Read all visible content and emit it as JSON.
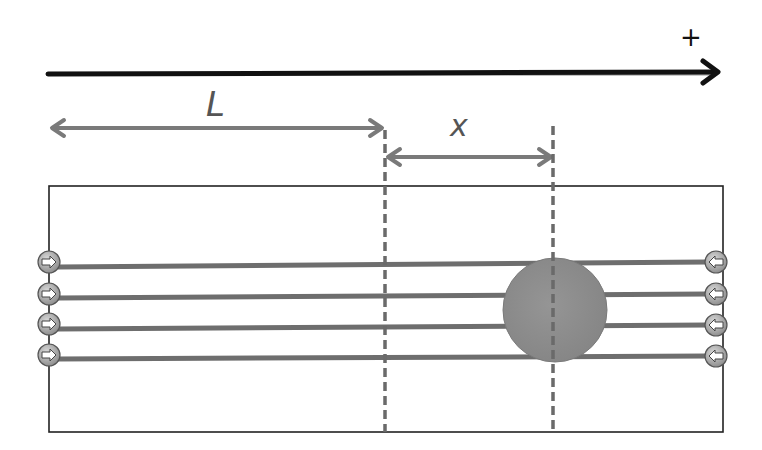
{
  "diagram": {
    "axis": {
      "direction_label": "+",
      "y": 74,
      "x_start": 48,
      "x_end": 718,
      "color": "#111111"
    },
    "dimensions": {
      "L": {
        "label": "L",
        "y": 128,
        "x_start": 50,
        "x_end": 383
      },
      "x": {
        "label": "x",
        "y": 157,
        "x_start": 387,
        "x_end": 552
      }
    },
    "dashed_lines": [
      {
        "x": 385,
        "y_start": 130,
        "y_end": 432
      },
      {
        "x": 553,
        "y_start": 126,
        "y_end": 432
      }
    ],
    "box": {
      "x": 49,
      "y": 186,
      "width": 674,
      "height": 246,
      "stroke": "#222222"
    },
    "field_lines": [
      {
        "y_left": 267,
        "y_right": 262
      },
      {
        "y_left": 298,
        "y_right": 294
      },
      {
        "y_left": 329,
        "y_right": 325
      },
      {
        "y_left": 359,
        "y_right": 356
      }
    ],
    "left_charges": {
      "x": 49,
      "arrow": "right",
      "count": 4
    },
    "right_charges": {
      "x": 716,
      "arrow": "left",
      "count": 4
    },
    "sphere": {
      "cx": 555,
      "cy": 310,
      "r": 52,
      "fill": "#8c8c8c"
    },
    "colors": {
      "field_line": "#6e6e6e",
      "dim_arrow": "#7a7a7a",
      "dashed": "#6a6a6a",
      "charge_fill": "#9a9a9a"
    }
  }
}
